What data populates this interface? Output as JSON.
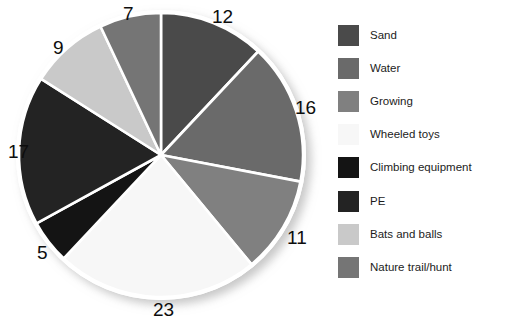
{
  "chart_data": {
    "type": "pie",
    "title": "",
    "subtitle": "",
    "xlabel": "",
    "ylabel": "",
    "grid": false,
    "legend_position": "right",
    "total": 100,
    "start_angle_deg": 0,
    "direction": "clockwise",
    "categories": [
      "Sand",
      "Water",
      "Growing",
      "Wheeled toys",
      "Climbing equipment",
      "PE",
      "Bats and balls",
      "Nature trail/hunt"
    ],
    "values": [
      12,
      16,
      11,
      23,
      5,
      17,
      9,
      7
    ],
    "colors": [
      "#4a4a4a",
      "#6a6a6a",
      "#808080",
      "#f7f7f7",
      "#141414",
      "#232323",
      "#c9c9c9",
      "#757575"
    ],
    "slice_border_color": "#ffffff",
    "slices": [
      {
        "label": "Sand",
        "value": 12,
        "color": "#4a4a4a",
        "data_label": "12"
      },
      {
        "label": "Water",
        "value": 16,
        "color": "#6a6a6a",
        "data_label": "16"
      },
      {
        "label": "Growing",
        "value": 11,
        "color": "#808080",
        "data_label": "11"
      },
      {
        "label": "Wheeled toys",
        "value": 23,
        "color": "#f7f7f7",
        "data_label": "23"
      },
      {
        "label": "Climbing equipment",
        "value": 5,
        "color": "#141414",
        "data_label": "5"
      },
      {
        "label": "PE",
        "value": 17,
        "color": "#232323",
        "data_label": "17"
      },
      {
        "label": "Bats and balls",
        "value": 9,
        "color": "#c9c9c9",
        "data_label": "9"
      },
      {
        "label": "Nature trail/hunt",
        "value": 7,
        "color": "#757575",
        "data_label": "7"
      }
    ]
  },
  "legend": {
    "items": [
      {
        "label": "Sand",
        "color": "#4a4a4a"
      },
      {
        "label": "Water",
        "color": "#6a6a6a"
      },
      {
        "label": "Growing",
        "color": "#808080"
      },
      {
        "label": "Wheeled toys",
        "color": "#f7f7f7"
      },
      {
        "label": "Climbing equipment",
        "color": "#141414"
      },
      {
        "label": "PE",
        "color": "#232323"
      },
      {
        "label": "Bats and balls",
        "color": "#c9c9c9"
      },
      {
        "label": "Nature trail/hunt",
        "color": "#757575"
      }
    ]
  },
  "value_labels": [
    {
      "text": "12",
      "x": 212,
      "y": 7
    },
    {
      "text": "16",
      "x": 295,
      "y": 98
    },
    {
      "text": "11",
      "x": 287,
      "y": 228
    },
    {
      "text": "23",
      "x": 153,
      "y": 300
    },
    {
      "text": "5",
      "x": 37,
      "y": 243
    },
    {
      "text": "17",
      "x": 8,
      "y": 142
    },
    {
      "text": "9",
      "x": 53,
      "y": 38
    },
    {
      "text": "7",
      "x": 123,
      "y": 4
    }
  ]
}
